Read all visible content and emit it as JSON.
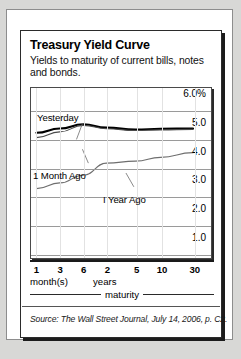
{
  "figure": {
    "title": "Treasury Yield Curve",
    "subtitle": "Yields to maturity of current bills, notes and bonds.",
    "source": "Source: The Wall Street Journal, July 14, 2006, p. C2.",
    "axis_group_months": "month(s)",
    "axis_group_years": "years",
    "axis_title": "maturity"
  },
  "chart_data": {
    "type": "line",
    "title": "Treasury Yield Curve",
    "subtitle": "Yields to maturity of current bills, notes and bonds.",
    "xlabel": "maturity",
    "ylabel": "",
    "x_tick_labels": [
      "1",
      "3",
      "6",
      "2",
      "5",
      "10",
      "30"
    ],
    "x_tick_units": [
      "month(s)",
      "month(s)",
      "month(s)",
      "years",
      "years",
      "years",
      "years"
    ],
    "x_positions_pct": [
      3,
      16,
      29,
      42,
      58,
      72,
      90
    ],
    "y_tick_labels": [
      "6.0%",
      "5.0",
      "4.0",
      "3.0",
      "2.0",
      "1.0"
    ],
    "y_values": [
      6.0,
      5.0,
      4.0,
      3.0,
      2.0,
      1.0
    ],
    "ylim": [
      0.5,
      6.5
    ],
    "grid": true,
    "legend_position": "inline-annotations",
    "series": [
      {
        "name": "Yesterday",
        "color": "#000000",
        "width": 2.2,
        "values": [
          4.92,
          5.07,
          5.22,
          5.1,
          5.03,
          5.06,
          5.07
        ]
      },
      {
        "name": "1 Month Ago",
        "color": "#4a4a4a",
        "width": 1.1,
        "values": [
          4.75,
          4.95,
          5.18,
          5.06,
          5.0,
          5.02,
          5.04
        ]
      },
      {
        "name": "I Year Ago",
        "color": "#6e6e6e",
        "width": 1.1,
        "values": [
          2.95,
          3.15,
          3.42,
          3.85,
          3.92,
          4.05,
          4.22
        ]
      }
    ],
    "annotations": [
      {
        "text": "Yesterday",
        "series": "Yesterday"
      },
      {
        "text": "1 Month Ago",
        "series": "1 Month Ago"
      },
      {
        "text": "I Year Ago",
        "series": "I Year Ago"
      }
    ]
  }
}
